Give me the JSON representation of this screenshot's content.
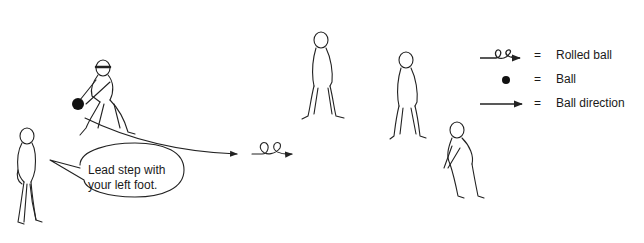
{
  "legend": {
    "items": [
      {
        "symbol": "rolled-ball-icon",
        "equals": "=",
        "label": "Rolled ball"
      },
      {
        "symbol": "ball-icon",
        "equals": "=",
        "label": "Ball"
      },
      {
        "symbol": "arrow-icon",
        "equals": "=",
        "label": "Ball direction"
      }
    ]
  },
  "speech_bubble": {
    "line1": "Lead step with",
    "line2": "your left foot."
  },
  "colors": {
    "line": "#222222",
    "background": "#ffffff"
  }
}
